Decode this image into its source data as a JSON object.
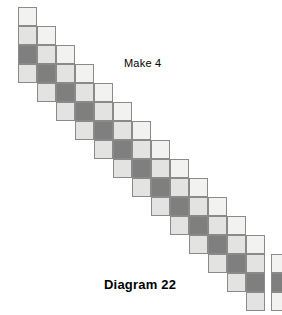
{
  "figure": {
    "caption": "Diagram 22",
    "caption_x": 104,
    "caption_y": 277,
    "instruction": "Make 4",
    "instruction_x": 124,
    "instruction_y": 57
  },
  "palette": {
    "dotted": "#f2f2f0",
    "light": "#e3e3e1",
    "dark": "#7f7f7f",
    "outline": "#8a8a8a",
    "background": "#ffffff",
    "text": "#000000"
  },
  "grid": {
    "cell_size": 19,
    "origin_x": 18,
    "origin_y": 7,
    "column_count": 13,
    "cells_per_column": 4,
    "row_offset_per_column": 1,
    "column_sequence": [
      "dotted",
      "light",
      "dark",
      "light"
    ]
  },
  "units": [
    {
      "name": "diagonal-strip",
      "columns": [
        {
          "col": 0,
          "row": 0,
          "cells": [
            "dotted",
            "light",
            "dark",
            "light"
          ]
        },
        {
          "col": 1,
          "row": 1,
          "cells": [
            "dotted",
            "light",
            "dark",
            "light"
          ]
        },
        {
          "col": 2,
          "row": 2,
          "cells": [
            "dotted",
            "light",
            "dark",
            "light"
          ]
        },
        {
          "col": 3,
          "row": 3,
          "cells": [
            "dotted",
            "light",
            "dark",
            "light"
          ]
        },
        {
          "col": 4,
          "row": 4,
          "cells": [
            "dotted",
            "light",
            "dark",
            "light"
          ]
        },
        {
          "col": 5,
          "row": 5,
          "cells": [
            "dotted",
            "light",
            "dark",
            "light"
          ]
        },
        {
          "col": 6,
          "row": 6,
          "cells": [
            "dotted",
            "light",
            "dark",
            "light"
          ]
        },
        {
          "col": 7,
          "row": 7,
          "cells": [
            "dotted",
            "light",
            "dark",
            "light"
          ]
        },
        {
          "col": 8,
          "row": 8,
          "cells": [
            "dotted",
            "light",
            "dark",
            "light"
          ]
        },
        {
          "col": 9,
          "row": 9,
          "cells": [
            "dotted",
            "light",
            "dark",
            "light"
          ]
        },
        {
          "col": 10,
          "row": 10,
          "cells": [
            "dotted",
            "light",
            "dark",
            "light"
          ]
        },
        {
          "col": 11,
          "row": 11,
          "cells": [
            "dotted",
            "light",
            "dark",
            "light"
          ]
        },
        {
          "col": 12,
          "row": 12,
          "cells": [
            "dotted",
            "light",
            "dark",
            "light"
          ]
        }
      ]
    },
    {
      "name": "end-unit",
      "columns": [
        {
          "col": 13,
          "row": 13,
          "gap_x": 6,
          "cells": [
            "dotted",
            "dark",
            "dotted"
          ]
        }
      ]
    }
  ]
}
